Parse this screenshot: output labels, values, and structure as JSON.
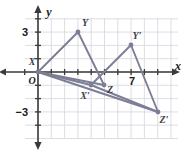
{
  "figure": {
    "type": "coordinate-plane-geometry",
    "background_color": "#ffffff",
    "grid_color": "#d9d9e2",
    "axis_color": "#3a3a3a",
    "shape_color": "#7d7d95",
    "label_color": "#1a1a1a",
    "point_label_color": "#3d3d4a"
  },
  "axes": {
    "x_label": "x",
    "y_label": "y",
    "origin_label": "O",
    "x_tick_labels": [
      {
        "text": "7",
        "value": 7
      }
    ],
    "y_tick_labels": [
      {
        "text": "3",
        "value": 3
      },
      {
        "text": "−3",
        "value": -3
      }
    ],
    "x_range": [
      -1,
      10.5
    ],
    "y_range": [
      -4.1,
      4.1
    ],
    "unit_px": 13.3,
    "origin_px": {
      "x": 38,
      "y": 72
    },
    "grid_bounds_px": {
      "left": 25,
      "top": 18,
      "right": 178,
      "bottom": 138
    }
  },
  "chart_data": {
    "type": "scatter",
    "title": "",
    "xlabel": "x",
    "ylabel": "y",
    "grid": true,
    "xlim": [
      -1,
      10.5
    ],
    "ylim": [
      -4.1,
      4.1
    ],
    "series": [
      {
        "name": "Triangle XYZ",
        "closed": true,
        "points": [
          {
            "label": "X",
            "x": 0,
            "y": 0,
            "px": 38,
            "py": 72,
            "lx": 32,
            "ly": 65
          },
          {
            "label": "Y",
            "x": 3,
            "y": 3,
            "px": 78,
            "py": 32,
            "lx": 85,
            "ly": 26
          },
          {
            "label": "Z",
            "x": 5,
            "y": -1,
            "px": 104,
            "py": 85,
            "lx": 110,
            "ly": 93
          }
        ]
      },
      {
        "name": "Triangle X'Y'Z'",
        "closed": true,
        "points": [
          {
            "label": "X′",
            "x": 4,
            "y": -1,
            "px": 91,
            "py": 85,
            "lx": 85,
            "ly": 99
          },
          {
            "label": "Y′",
            "x": 7,
            "y": 2,
            "px": 131,
            "py": 45,
            "lx": 137,
            "ly": 39
          },
          {
            "label": "Z′",
            "x": 9,
            "y": -3,
            "px": 158,
            "py": 112,
            "lx": 164,
            "ly": 123
          }
        ]
      }
    ],
    "connectors": [
      {
        "from": "X",
        "to": "X′",
        "note": "ray from X through X′"
      },
      {
        "from": "X",
        "to": "Z′",
        "note": "ray from X through Z′"
      }
    ]
  }
}
